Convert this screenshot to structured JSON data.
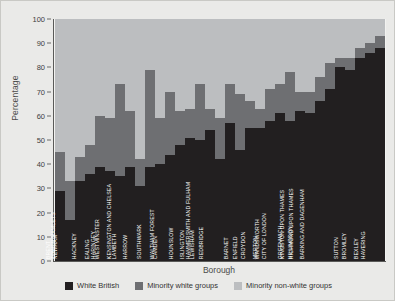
{
  "chart_data": {
    "type": "bar",
    "subtype": "stacked-percentage",
    "title": "",
    "xlabel": "Borough",
    "ylabel": "Percentage",
    "ylim": [
      0,
      100
    ],
    "yticks": [
      0,
      10,
      20,
      30,
      40,
      50,
      60,
      70,
      80,
      90,
      100
    ],
    "grid": false,
    "legend_position": "bottom",
    "colors": {
      "white_british": "#221f20",
      "minority_white": "#6e6f72",
      "minority_non_white": "#bcbec0",
      "figure_background": "#eaeae8",
      "plot_background": "#f2f2f0",
      "axis": "#5a5a58"
    },
    "categories": [
      "BRENT",
      "NEWHAM",
      "TOWER HAMLETS",
      "HACKNEY",
      "EALING",
      "HARINGEY",
      "WESTMINSTER",
      "LAMBETH",
      "HARROW",
      "KENSINGTON AND CHELSEA",
      "SOUTHWARK",
      "CAMDEN",
      "WALTHAM FOREST",
      "HOUNSLOW",
      "ISLINGTON",
      "LEWISHAM",
      "REDBRIDGE",
      "HAMMERSMITH AND FULHAM",
      "BARNET",
      "ENFIELD",
      "CROYDON",
      "MERTON",
      "WANDSWORTH",
      "CITY OF LONDON",
      "GREENWICH",
      "HILLINGDON",
      "KINGSTON UPON THAMES",
      "RICHMOND UPON THAMES",
      "BARKING AND DAGENHAM",
      "SUTTON",
      "BROMLEY",
      "BEXLEY",
      "HAVERING"
    ],
    "series": [
      {
        "name": "White British",
        "color": "#221f20",
        "values": [
          29,
          17,
          33,
          36,
          39,
          37,
          35,
          39,
          31,
          39,
          40,
          44,
          48,
          51,
          50,
          54,
          42,
          57,
          46,
          55,
          55,
          58,
          61,
          58,
          62,
          61,
          66,
          71,
          80,
          79,
          84,
          86,
          88
        ]
      },
      {
        "name": "Minority white groups",
        "color": "#6e6f72",
        "values": [
          16,
          16,
          10,
          12,
          21,
          22,
          38,
          23,
          11,
          40,
          19,
          26,
          14,
          12,
          23,
          9,
          17,
          16,
          23,
          11,
          8,
          13,
          12,
          20,
          8,
          9,
          10,
          11,
          4,
          5,
          4,
          4,
          5
        ]
      },
      {
        "name": "Minority non-white groups",
        "color": "#bcbec0",
        "values": [
          55,
          67,
          57,
          52,
          40,
          41,
          27,
          38,
          58,
          21,
          41,
          30,
          38,
          37,
          27,
          37,
          41,
          27,
          31,
          34,
          37,
          29,
          27,
          22,
          30,
          30,
          24,
          18,
          16,
          16,
          12,
          10,
          7
        ]
      }
    ]
  },
  "legend": {
    "items": [
      {
        "label": "White British",
        "color": "#221f20"
      },
      {
        "label": "Minority white groups",
        "color": "#6e6f72"
      },
      {
        "label": "Minority non-white groups",
        "color": "#bcbec0"
      }
    ]
  }
}
